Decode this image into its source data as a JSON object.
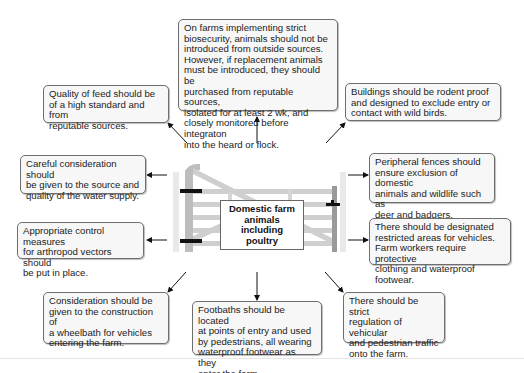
{
  "diagram": {
    "center": {
      "label": "Domestic farm\nanimals including\npoultry",
      "image": "farm-gate-icon"
    },
    "boxes": [
      {
        "id": "biosecurity-sources",
        "text": "On farms implementing strict\nbiosecurity, animals should not be\nintroduced from outside sources.\nHowever, if replacement animals\nmust be introduced, they should be\npurchased from reputable sources,\nisolated for at least 2 wk, and\nclosely monitored before integraton\ninto the heard or flock."
      },
      {
        "id": "feed-quality",
        "text": "Quality of feed should be\nof a high standard and from\nreputable sources."
      },
      {
        "id": "buildings",
        "text": "Buildings should be rodent proof\nand designed to exclude entry or\ncontact with wild birds."
      },
      {
        "id": "water-supply",
        "text": "Careful consideration should\nbe given to the source and\nquality of the water supply."
      },
      {
        "id": "peripheral-fences",
        "text": "Peripheral fences should\nensure exclusion of domestic\nanimals and wildlife such as\ndeer and badgers."
      },
      {
        "id": "arthropod-vectors",
        "text": "Appropriate control measures\nfor arthropod vectors should\nbe put in place."
      },
      {
        "id": "restricted-areas",
        "text": "There should be designated\nrestricted areas for vehicles.\nFarm workers require protective\nclothing and waterproof footwear."
      },
      {
        "id": "wheelbath",
        "text": "Consideration should be\ngiven to the construction of\na wheelbath for vehicles\nentering the farm."
      },
      {
        "id": "footbaths",
        "text": "Footbaths should be located\nat points of entry and used\nby pedestrians, all wearing\nwaterproof footwear as they\nenter the farm."
      },
      {
        "id": "traffic-regulation",
        "text": "There should be strict\nregulation of vehicular\nand pedestrian traffic\nonto the farm."
      }
    ],
    "colors": {
      "box_border": "#6e6e6e",
      "box_fill": "#f7f7f7",
      "arrow": "#111111",
      "gate_wood": "#c8c8c8"
    }
  }
}
